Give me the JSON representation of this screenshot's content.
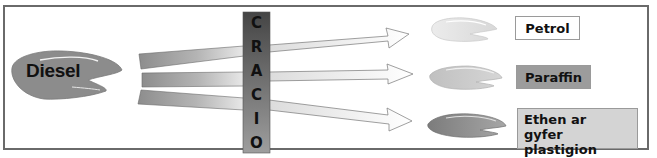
{
  "diagram": {
    "type": "process-flow",
    "source": {
      "label": "Diesel",
      "color": "#8c8c8c"
    },
    "process": {
      "label": "CRACIO",
      "letters": [
        "C",
        "R",
        "A",
        "C",
        "I",
        "O"
      ],
      "color_top": "#4a4a4a",
      "color_bottom": "#9a9a9a"
    },
    "products": [
      {
        "label": "Petrol",
        "box_color": "#ffffff",
        "blob_color": "#e2e2e2"
      },
      {
        "label": "Paraffin",
        "box_color": "#9c9c9c",
        "blob_color": "#c4c4c4"
      },
      {
        "label_line1": "Ethen ar",
        "label_line2": "gyfer plastigion",
        "box_color": "#d4d4d4",
        "blob_color": "#8a8a8a"
      }
    ],
    "arrows": 3
  }
}
